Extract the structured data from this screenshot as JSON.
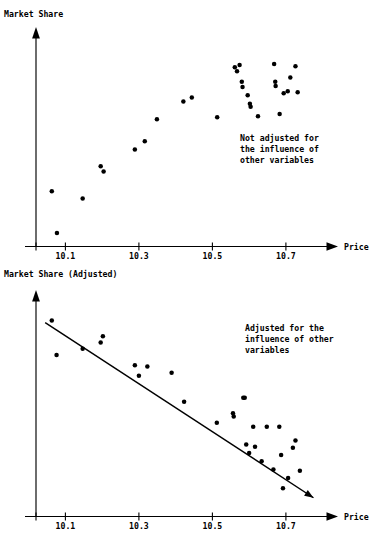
{
  "figure": {
    "background_color": "#ffffff",
    "ink_color": "#000000"
  },
  "panels": {
    "top": {
      "name": "unadjusted-scatter",
      "y_axis_label": "Market Share",
      "x_axis_label": "Price",
      "annotation": [
        "Not adjusted for",
        "the influence of",
        "other variables"
      ],
      "x_ticks": [
        "10.1",
        "10.3",
        "10.5",
        "10.7"
      ]
    },
    "bottom": {
      "name": "adjusted-scatter",
      "y_axis_label": "Market Share (Adjusted)",
      "x_axis_label": "Price",
      "annotation": [
        "Adjusted for the",
        "influence of other",
        "variables"
      ],
      "x_ticks": [
        "10.1",
        "10.3",
        "10.5",
        "10.7"
      ]
    }
  },
  "chart_data": [
    {
      "type": "scatter",
      "id": "unadjusted",
      "title": "Market Share vs Price - Not adjusted",
      "xlabel": "Price",
      "ylabel": "Market Share",
      "xlim": [
        10.02,
        10.82
      ],
      "ylim": [
        0,
        100
      ],
      "xticks": [
        10.1,
        10.3,
        10.5,
        10.7
      ],
      "grid": false,
      "legend": false,
      "annotations": [
        {
          "text": "Not adjusted for the influence of other variables",
          "x": 10.61,
          "y": 34
        }
      ],
      "points": [
        {
          "x": 10.063,
          "y": 26.5
        },
        {
          "x": 10.077,
          "y": 6.5
        },
        {
          "x": 10.147,
          "y": 23.0
        },
        {
          "x": 10.196,
          "y": 38.5
        },
        {
          "x": 10.204,
          "y": 36.0
        },
        {
          "x": 10.289,
          "y": 46.5
        },
        {
          "x": 10.316,
          "y": 50.5
        },
        {
          "x": 10.349,
          "y": 61.0
        },
        {
          "x": 10.421,
          "y": 69.5
        },
        {
          "x": 10.444,
          "y": 71.5
        },
        {
          "x": 10.513,
          "y": 62.0
        },
        {
          "x": 10.561,
          "y": 86.0
        },
        {
          "x": 10.567,
          "y": 84.0
        },
        {
          "x": 10.574,
          "y": 87.0
        },
        {
          "x": 10.58,
          "y": 79.0
        },
        {
          "x": 10.582,
          "y": 76.5
        },
        {
          "x": 10.596,
          "y": 72.5
        },
        {
          "x": 10.602,
          "y": 68.5
        },
        {
          "x": 10.604,
          "y": 67.0
        },
        {
          "x": 10.624,
          "y": 62.5
        },
        {
          "x": 10.668,
          "y": 87.5
        },
        {
          "x": 10.671,
          "y": 79.0
        },
        {
          "x": 10.672,
          "y": 77.0
        },
        {
          "x": 10.683,
          "y": 63.5
        },
        {
          "x": 10.694,
          "y": 73.5
        },
        {
          "x": 10.705,
          "y": 74.5
        },
        {
          "x": 10.712,
          "y": 81.0
        },
        {
          "x": 10.726,
          "y": 86.5
        },
        {
          "x": 10.732,
          "y": 74.0
        }
      ]
    },
    {
      "type": "scatter",
      "id": "adjusted",
      "title": "Market Share (Adjusted) vs Price - Adjusted",
      "xlabel": "Price",
      "ylabel": "Market Share (Adjusted)",
      "xlim": [
        10.02,
        10.82
      ],
      "ylim": [
        0,
        100
      ],
      "xticks": [
        10.1,
        10.3,
        10.5,
        10.7
      ],
      "grid": false,
      "legend": false,
      "trend_line": {
        "type": "linear-fit",
        "x_start": 10.045,
        "y_start": 93.0,
        "x_end": 10.775,
        "y_end": 9.0,
        "has_arrow_end": true
      },
      "annotations": [
        {
          "text": "Adjusted for the influence of other variables",
          "x": 10.61,
          "y": 80
        }
      ],
      "points": [
        {
          "x": 10.063,
          "y": 94.0
        },
        {
          "x": 10.076,
          "y": 77.5
        },
        {
          "x": 10.147,
          "y": 80.5
        },
        {
          "x": 10.196,
          "y": 83.5
        },
        {
          "x": 10.202,
          "y": 86.5
        },
        {
          "x": 10.289,
          "y": 72.5
        },
        {
          "x": 10.3,
          "y": 67.5
        },
        {
          "x": 10.323,
          "y": 72.0
        },
        {
          "x": 10.389,
          "y": 69.0
        },
        {
          "x": 10.423,
          "y": 55.0
        },
        {
          "x": 10.512,
          "y": 45.0
        },
        {
          "x": 10.556,
          "y": 49.5
        },
        {
          "x": 10.558,
          "y": 48.0
        },
        {
          "x": 10.584,
          "y": 57.0
        },
        {
          "x": 10.588,
          "y": 57.0
        },
        {
          "x": 10.592,
          "y": 34.5
        },
        {
          "x": 10.6,
          "y": 30.5
        },
        {
          "x": 10.611,
          "y": 43.0
        },
        {
          "x": 10.616,
          "y": 33.5
        },
        {
          "x": 10.634,
          "y": 26.5
        },
        {
          "x": 10.648,
          "y": 43.0
        },
        {
          "x": 10.666,
          "y": 22.5
        },
        {
          "x": 10.682,
          "y": 43.0
        },
        {
          "x": 10.687,
          "y": 29.5
        },
        {
          "x": 10.692,
          "y": 13.5
        },
        {
          "x": 10.706,
          "y": 18.5
        },
        {
          "x": 10.719,
          "y": 33.0
        },
        {
          "x": 10.726,
          "y": 36.5
        },
        {
          "x": 10.738,
          "y": 22.0
        }
      ]
    }
  ]
}
